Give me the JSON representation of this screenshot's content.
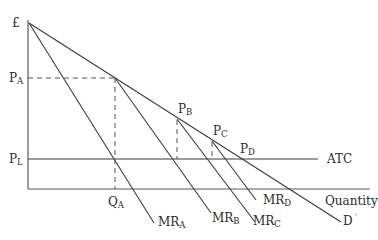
{
  "diagram": {
    "type": "economics-price-discrimination",
    "y_axis_label": "£",
    "x_axis_label": "Quantity",
    "price_labels": {
      "PA": {
        "main": "P",
        "sub": "A"
      },
      "PB": {
        "main": "P",
        "sub": "B"
      },
      "PC": {
        "main": "P",
        "sub": "C"
      },
      "PD": {
        "main": "P",
        "sub": "D"
      },
      "PL": {
        "main": "P",
        "sub": "L"
      }
    },
    "quantity_labels": {
      "QA": {
        "main": "Q",
        "sub": "A"
      }
    },
    "curves": {
      "demand": {
        "main": "D",
        "suffix": " ′"
      },
      "atc": "ATC",
      "MRA": {
        "main": "MR",
        "sub": "A"
      },
      "MRB": {
        "main": "MR",
        "sub": "B"
      },
      "MRC": {
        "main": "MR",
        "sub": "C"
      },
      "MRD": {
        "main": "MR",
        "sub": "D"
      }
    }
  }
}
